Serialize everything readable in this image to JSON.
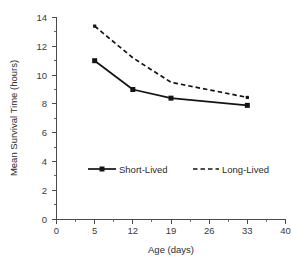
{
  "chart_data": {
    "type": "line",
    "title": "",
    "subtitle": "",
    "xlabel": "Age (days)",
    "ylabel": "Mean Survival Time (hours)",
    "x_tick_labels": [
      "0",
      "5",
      "12",
      "19",
      "26",
      "33",
      "40"
    ],
    "y_tick_labels": [
      "0",
      "2",
      "4",
      "6",
      "8",
      "10",
      "12",
      "14"
    ],
    "xlim": [
      0,
      40
    ],
    "ylim": [
      0,
      14
    ],
    "x_axis_spacing": "categorical-even",
    "grid": false,
    "legend_position": "inside-lower-center",
    "categories": [
      5,
      12,
      19,
      33
    ],
    "series": [
      {
        "name": "Short-Lived",
        "style": "solid",
        "marker": "square",
        "color": "#141414",
        "x": [
          5,
          12,
          19,
          33
        ],
        "values": [
          11.0,
          9.0,
          8.4,
          7.9
        ]
      },
      {
        "name": "Long-Lived",
        "style": "dashed",
        "marker": "none",
        "color": "#141414",
        "x": [
          5,
          12,
          19,
          33
        ],
        "values": [
          13.4,
          11.2,
          9.5,
          8.45
        ]
      }
    ]
  },
  "axes": {
    "y_title": "Mean Survival Time (hours)",
    "x_title": "Age (days)",
    "y_ticks": [
      "14",
      "12",
      "10",
      "8",
      "6",
      "4",
      "2",
      "0"
    ],
    "x_ticks": [
      "0",
      "5",
      "12",
      "19",
      "26",
      "33",
      "40"
    ]
  },
  "legend": {
    "items": [
      {
        "label": "Short-Lived",
        "style": "solid",
        "marker": "square"
      },
      {
        "label": "Long-Lived",
        "style": "dashed",
        "marker": "none"
      }
    ]
  },
  "colors": {
    "series_line": "#141414",
    "axis": "#4a4a4a",
    "text": "#2b2b2b",
    "background": "#ffffff"
  }
}
